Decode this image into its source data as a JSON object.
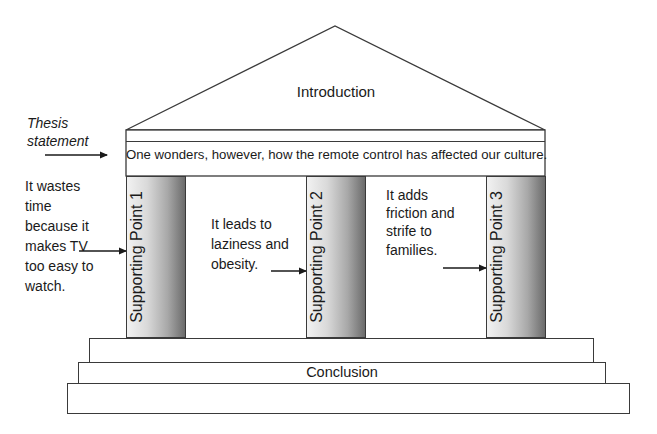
{
  "diagram": {
    "roof": {
      "label": "Introduction"
    },
    "thesis": {
      "label": "Thesis statement",
      "text": "One wonders, however, how the remote control has affected our culture."
    },
    "columns": [
      {
        "label": "Supporting Point 1",
        "note": "It wastes time because it makes TV too easy to watch."
      },
      {
        "label": "Supporting Point 2",
        "note": "It leads to laziness and obesity."
      },
      {
        "label": "Supporting Point 3",
        "note": "It adds friction and strife to families."
      }
    ],
    "foundation": {
      "label": "Conclusion"
    },
    "colors": {
      "line": "#3a3a3a",
      "column_gradient_light": "#f2f2f2",
      "column_gradient_dark": "#6b6b6b",
      "background": "#ffffff"
    }
  }
}
